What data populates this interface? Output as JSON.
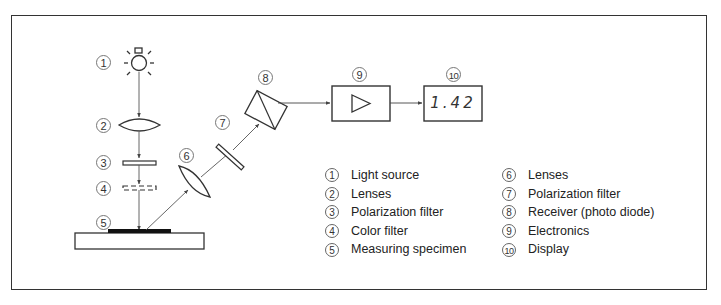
{
  "figure": {
    "type": "schematic"
  },
  "callouts": [
    {
      "id": "1",
      "label": "1"
    },
    {
      "id": "2",
      "label": "2"
    },
    {
      "id": "3",
      "label": "3"
    },
    {
      "id": "4",
      "label": "4"
    },
    {
      "id": "5",
      "label": "5"
    },
    {
      "id": "6",
      "label": "6"
    },
    {
      "id": "7",
      "label": "7"
    },
    {
      "id": "8",
      "label": "8"
    },
    {
      "id": "9",
      "label": "9"
    },
    {
      "id": "10",
      "label": "10"
    }
  ],
  "display": {
    "value": "1.42"
  },
  "legend": {
    "left": [
      {
        "num": "1",
        "text": "Light source"
      },
      {
        "num": "2",
        "text": "Lenses"
      },
      {
        "num": "3",
        "text": "Polarization filter"
      },
      {
        "num": "4",
        "text": "Color filter"
      },
      {
        "num": "5",
        "text": "Measuring specimen"
      }
    ],
    "right": [
      {
        "num": "6",
        "text": "Lenses"
      },
      {
        "num": "7",
        "text": "Polarization filter"
      },
      {
        "num": "8",
        "text": "Receiver (photo diode)"
      },
      {
        "num": "9",
        "text": "Electronics"
      },
      {
        "num": "10",
        "text": "Display"
      }
    ]
  },
  "components": {
    "light_source": "lightbulb-icon",
    "lens_1": "convex-lens",
    "polarizer_1": "filter-plate",
    "color_filter": "dashed-filter-plate",
    "specimen": "specimen-on-base",
    "lens_2": "convex-lens",
    "polarizer_2": "filter-plate",
    "receiver": "prism-photodiode",
    "electronics": "amplifier-triangle",
    "display": "digital-readout"
  }
}
